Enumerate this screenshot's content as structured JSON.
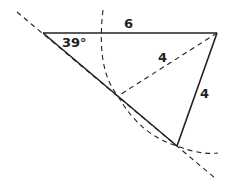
{
  "diagram": {
    "type": "ambiguous-case triangle construction",
    "labels": {
      "top_side": "6",
      "dashed_radius": "4",
      "right_side": "4",
      "angle": "39°"
    },
    "colors": {
      "stroke": "#222222",
      "background": "#ffffff"
    }
  }
}
